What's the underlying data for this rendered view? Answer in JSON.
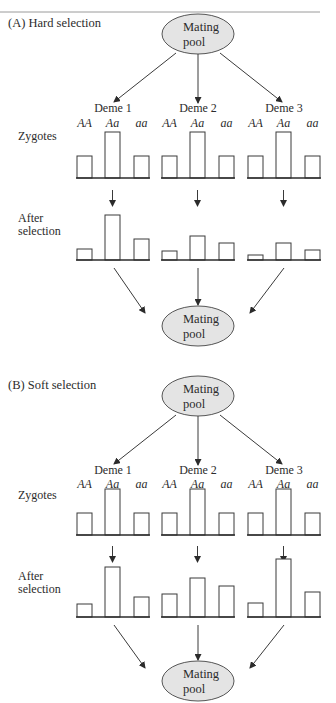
{
  "figure": {
    "pool_label_line1": "Mating",
    "pool_label_line2": "pool",
    "row_labels": {
      "zygotes": "Zygotes",
      "after_line1": "After",
      "after_line2": "selection"
    },
    "genotypes": [
      "AA",
      "Aa",
      "aa"
    ],
    "demes": [
      "Deme 1",
      "Deme 2",
      "Deme 3"
    ],
    "colors": {
      "pool_fill": "#e4e4e4",
      "stroke": "#3a3a3a",
      "text": "#2b2b2b"
    }
  },
  "panels": [
    {
      "id": "A",
      "title": "(A) Hard selection",
      "zygotes": [
        [
          22,
          46,
          22
        ],
        [
          22,
          46,
          22
        ],
        [
          22,
          46,
          22
        ]
      ],
      "after_selection": [
        [
          11,
          45,
          21
        ],
        [
          9,
          24,
          17
        ],
        [
          5,
          17,
          10
        ]
      ]
    },
    {
      "id": "B",
      "title": "(B) Soft selection",
      "zygotes": [
        [
          22,
          46,
          22
        ],
        [
          22,
          46,
          22
        ],
        [
          22,
          46,
          22
        ]
      ],
      "after_selection": [
        [
          13,
          50,
          20
        ],
        [
          23,
          39,
          31
        ],
        [
          14,
          58,
          25
        ]
      ]
    }
  ],
  "chart_data": [
    {
      "type": "bar",
      "title": "(A) Hard selection — Zygotes",
      "categories": [
        "AA",
        "Aa",
        "aa"
      ],
      "series": [
        {
          "name": "Deme 1",
          "values": [
            22,
            46,
            22
          ]
        },
        {
          "name": "Deme 2",
          "values": [
            22,
            46,
            22
          ]
        },
        {
          "name": "Deme 3",
          "values": [
            22,
            46,
            22
          ]
        }
      ],
      "xlabel": "",
      "ylabel": "",
      "grid": false
    },
    {
      "type": "bar",
      "title": "(A) Hard selection — After selection",
      "categories": [
        "AA",
        "Aa",
        "aa"
      ],
      "series": [
        {
          "name": "Deme 1",
          "values": [
            11,
            45,
            21
          ]
        },
        {
          "name": "Deme 2",
          "values": [
            9,
            24,
            17
          ]
        },
        {
          "name": "Deme 3",
          "values": [
            5,
            17,
            10
          ]
        }
      ],
      "xlabel": "",
      "ylabel": "",
      "grid": false
    },
    {
      "type": "bar",
      "title": "(B) Soft selection — Zygotes",
      "categories": [
        "AA",
        "Aa",
        "aa"
      ],
      "series": [
        {
          "name": "Deme 1",
          "values": [
            22,
            46,
            22
          ]
        },
        {
          "name": "Deme 2",
          "values": [
            22,
            46,
            22
          ]
        },
        {
          "name": "Deme 3",
          "values": [
            22,
            46,
            22
          ]
        }
      ],
      "xlabel": "",
      "ylabel": "",
      "grid": false
    },
    {
      "type": "bar",
      "title": "(B) Soft selection — After selection",
      "categories": [
        "AA",
        "Aa",
        "aa"
      ],
      "series": [
        {
          "name": "Deme 1",
          "values": [
            13,
            50,
            20
          ]
        },
        {
          "name": "Deme 2",
          "values": [
            23,
            39,
            31
          ]
        },
        {
          "name": "Deme 3",
          "values": [
            14,
            58,
            25
          ]
        }
      ],
      "xlabel": "",
      "ylabel": "",
      "grid": false
    }
  ]
}
